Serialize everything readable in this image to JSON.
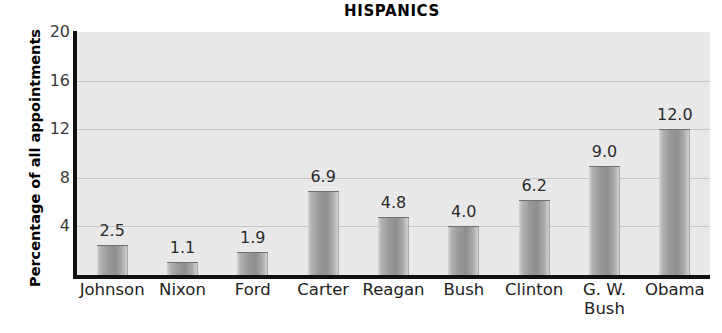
{
  "chart_data": {
    "type": "bar",
    "title": "HISPANICS",
    "xlabel": "",
    "ylabel": "Percentage of all appointments",
    "categories": [
      "Johnson",
      "Nixon",
      "Ford",
      "Carter",
      "Reagan",
      "Bush",
      "Clinton",
      "G. W. Bush",
      "Obama"
    ],
    "category_lines": [
      [
        "Johnson"
      ],
      [
        "Nixon"
      ],
      [
        "Ford"
      ],
      [
        "Carter"
      ],
      [
        "Reagan"
      ],
      [
        "Bush"
      ],
      [
        "Clinton"
      ],
      [
        "G. W.",
        "Bush"
      ],
      [
        "Obama"
      ]
    ],
    "values": [
      2.5,
      1.1,
      1.9,
      6.9,
      4.8,
      4.0,
      6.2,
      9.0,
      12.0
    ],
    "value_labels": [
      "2.5",
      "1.1",
      "1.9",
      "6.9",
      "4.8",
      "4.0",
      "6.2",
      "9.0",
      "12.0"
    ],
    "ylim": [
      0,
      20
    ],
    "yticks": [
      20,
      16,
      12,
      8,
      4
    ],
    "ytick_labels": [
      "20",
      "16",
      "12",
      "8",
      "4"
    ],
    "gridlines": [
      16,
      12,
      8,
      4
    ],
    "grid": true,
    "legend": "none",
    "colors": {
      "plot_background": "#e9e9e9",
      "page_background": "#ffffff",
      "bar_fill": "#9a9a9a",
      "bar_highlight": "#d8d8d8",
      "axis": "#111111",
      "gridline": "#c6c6c6",
      "text": "#222222"
    }
  }
}
